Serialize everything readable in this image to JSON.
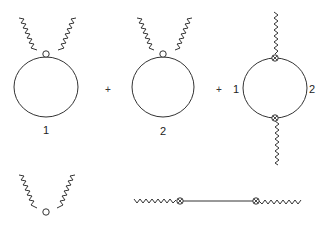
{
  "diagram": {
    "type": "feynman-diagrams",
    "colors": {
      "line": "#333333",
      "background": "#ffffff"
    },
    "top_row": {
      "terms": [
        {
          "id": "loop-1",
          "label": "1",
          "vertex": "open-circle",
          "external_legs": 2
        },
        {
          "id": "loop-2",
          "label": "2",
          "vertex": "open-circle",
          "external_legs": 2
        },
        {
          "id": "loop-12",
          "left_label": "1",
          "right_label": "2",
          "vertex": "crossed-circle",
          "vertices": 2,
          "external_legs": 2
        }
      ],
      "operators": [
        "+",
        "+"
      ]
    },
    "bottom_row": {
      "items": [
        {
          "id": "contact-vertex",
          "vertex": "open-circle",
          "external_legs": 2
        },
        {
          "id": "propagator",
          "vertex": "crossed-circle",
          "vertices": 2,
          "external_legs": 2
        }
      ]
    }
  }
}
